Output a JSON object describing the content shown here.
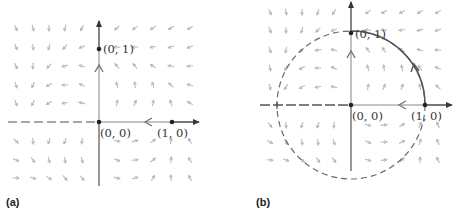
{
  "figure": {
    "panels": [
      {
        "id": "a",
        "tag": "(a)",
        "origin_px": [
          99,
          122
        ],
        "unit_px": 73,
        "points": [
          {
            "label": "(0, 1)",
            "x": 0,
            "y": 1
          },
          {
            "label": "(0, 0)",
            "x": 0,
            "y": 0
          },
          {
            "label": "(1, 0)",
            "x": 1,
            "y": 0
          }
        ],
        "flow_arrows": [
          {
            "on": "y-axis",
            "direction": "up"
          },
          {
            "on": "x-axis",
            "direction": "left"
          }
        ],
        "has_circle": false
      },
      {
        "id": "b",
        "tag": "(b)",
        "origin_px": [
          351,
          105
        ],
        "unit_px": 74,
        "points": [
          {
            "label": "(0, 1)",
            "x": 0,
            "y": 1
          },
          {
            "label": "(0, 0)",
            "x": 0,
            "y": 0
          },
          {
            "label": "(1, 0)",
            "x": 1,
            "y": 0
          }
        ],
        "flow_arrows": [
          {
            "on": "y-axis",
            "direction": "up"
          },
          {
            "on": "x-axis",
            "direction": "left"
          },
          {
            "on": "unit-circle-arc",
            "direction": "counterclockwise"
          }
        ],
        "has_circle": true,
        "circle": {
          "radius": 1,
          "style": "dashed",
          "highlighted_arc": "from (1, 0) to (0, 1)"
        }
      }
    ],
    "colors": {
      "axis": "#444444",
      "axis_light": "#9a9a9a",
      "field": "#b8b8b8",
      "circle": "#6a6a6a",
      "arc": "#555555",
      "text": "#333333"
    }
  }
}
